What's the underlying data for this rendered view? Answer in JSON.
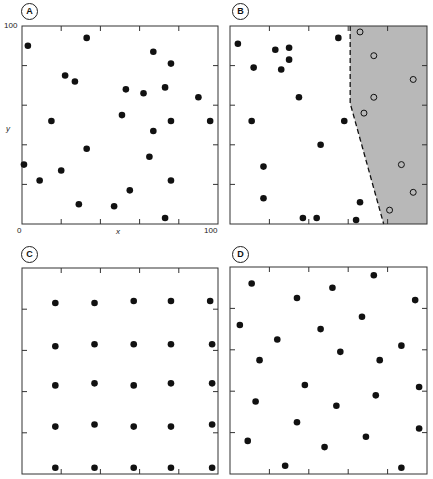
{
  "figure": {
    "panels": [
      {
        "id": "A",
        "label": "A"
      },
      {
        "id": "B",
        "label": "B"
      },
      {
        "id": "C",
        "label": "C"
      },
      {
        "id": "D",
        "label": "D"
      }
    ],
    "axis": {
      "x_label": "x",
      "y_label": "y",
      "origin": "0",
      "x_max": "100",
      "y_max": "100"
    },
    "colors": {
      "dot": "#111111",
      "frame": "#333333",
      "shade": "#b8b8b8"
    }
  },
  "chart_data": [
    {
      "type": "scatter",
      "panel": "A",
      "title": "A",
      "xlabel": "x",
      "ylabel": "y",
      "xlim": [
        0,
        100
      ],
      "ylim": [
        0,
        100
      ],
      "ticks": [
        0,
        20,
        40,
        60,
        80,
        100
      ],
      "series": [
        {
          "name": "random",
          "marker": "filled",
          "points": [
            [
              3,
              90
            ],
            [
              33,
              94
            ],
            [
              22,
              75
            ],
            [
              27,
              72
            ],
            [
              67,
              87
            ],
            [
              76,
              81
            ],
            [
              73,
              69
            ],
            [
              53,
              68
            ],
            [
              62,
              66
            ],
            [
              90,
              64
            ],
            [
              51,
              55
            ],
            [
              76,
              52
            ],
            [
              96,
              52
            ],
            [
              15,
              52
            ],
            [
              67,
              47
            ],
            [
              33,
              38
            ],
            [
              65,
              34
            ],
            [
              1,
              30
            ],
            [
              20,
              27
            ],
            [
              9,
              22
            ],
            [
              76,
              22
            ],
            [
              55,
              17
            ],
            [
              29,
              10
            ],
            [
              47,
              9
            ],
            [
              73,
              3
            ]
          ]
        }
      ]
    },
    {
      "type": "scatter",
      "panel": "B",
      "title": "B",
      "xlim": [
        0,
        100
      ],
      "ylim": [
        0,
        100
      ],
      "boundary": {
        "style": "dashed",
        "points": [
          [
            61,
            100
          ],
          [
            61,
            61
          ],
          [
            78,
            0
          ]
        ],
        "shaded_side": "right"
      },
      "series": [
        {
          "name": "outside",
          "marker": "filled",
          "points": [
            [
              4,
              91
            ],
            [
              23,
              88
            ],
            [
              30,
              89
            ],
            [
              30,
              83
            ],
            [
              26,
              78
            ],
            [
              12,
              79
            ],
            [
              35,
              64
            ],
            [
              11,
              52
            ],
            [
              55,
              94
            ],
            [
              58,
              52
            ],
            [
              46,
              40
            ],
            [
              17,
              29
            ],
            [
              17,
              13
            ],
            [
              37,
              3
            ],
            [
              44,
              3
            ],
            [
              64,
              2
            ],
            [
              66,
              11
            ]
          ]
        },
        {
          "name": "inside",
          "marker": "open",
          "points": [
            [
              66,
              97
            ],
            [
              73,
              85
            ],
            [
              93,
              73
            ],
            [
              73,
              64
            ],
            [
              68,
              56
            ],
            [
              87,
              30
            ],
            [
              93,
              16
            ],
            [
              81,
              7
            ]
          ]
        }
      ]
    },
    {
      "type": "scatter",
      "panel": "C",
      "title": "C",
      "xlim": [
        0,
        100
      ],
      "ylim": [
        0,
        100
      ],
      "series": [
        {
          "name": "regular",
          "marker": "filled",
          "points": [
            [
              17,
              83
            ],
            [
              37,
              83
            ],
            [
              57,
              84
            ],
            [
              76,
              84
            ],
            [
              96,
              84
            ],
            [
              17,
              62
            ],
            [
              37,
              63
            ],
            [
              57,
              63
            ],
            [
              76,
              63
            ],
            [
              97,
              63
            ],
            [
              17,
              43
            ],
            [
              37,
              44
            ],
            [
              57,
              43
            ],
            [
              76,
              44
            ],
            [
              97,
              44
            ],
            [
              17,
              23
            ],
            [
              37,
              24
            ],
            [
              57,
              23
            ],
            [
              76,
              23
            ],
            [
              97,
              24
            ],
            [
              17,
              3
            ],
            [
              37,
              3
            ],
            [
              57,
              3
            ],
            [
              76,
              3
            ],
            [
              97,
              3
            ]
          ]
        }
      ]
    },
    {
      "type": "scatter",
      "panel": "D",
      "title": "D",
      "xlim": [
        0,
        100
      ],
      "ylim": [
        0,
        100
      ],
      "series": [
        {
          "name": "stratified",
          "marker": "filled",
          "points": [
            [
              11,
              92
            ],
            [
              34,
              85
            ],
            [
              52,
              90
            ],
            [
              73,
              96
            ],
            [
              94,
              84
            ],
            [
              5,
              72
            ],
            [
              24,
              65
            ],
            [
              46,
              70
            ],
            [
              67,
              76
            ],
            [
              87,
              62
            ],
            [
              15,
              55
            ],
            [
              56,
              59
            ],
            [
              76,
              55
            ],
            [
              38,
              43
            ],
            [
              96,
              42
            ],
            [
              13,
              35
            ],
            [
              54,
              33
            ],
            [
              74,
              38
            ],
            [
              34,
              25
            ],
            [
              96,
              22
            ],
            [
              9,
              16
            ],
            [
              69,
              18
            ],
            [
              48,
              13
            ],
            [
              28,
              4
            ],
            [
              87,
              3
            ]
          ]
        }
      ]
    }
  ]
}
